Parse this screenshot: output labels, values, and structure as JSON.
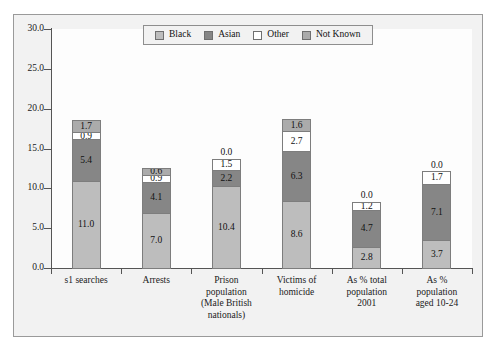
{
  "chart_data": {
    "type": "bar",
    "stacked": true,
    "title": "",
    "subtitle": "",
    "xlabel": "",
    "ylabel": "",
    "ylim": [
      0,
      30
    ],
    "ytick_labels": [
      "0.0",
      "5.0",
      "10.0",
      "15.0",
      "20.0",
      "25.0",
      "30.0"
    ],
    "ytick_values": [
      0,
      5,
      10,
      15,
      20,
      25,
      30
    ],
    "grid": false,
    "legend_position": "top-center",
    "categories": [
      "s1 searches",
      "Arrests",
      "Prison population (Male British nationals)",
      "Victims of homicide",
      "As % total population 2001",
      "As % population aged 10-24"
    ],
    "category_lines": [
      [
        "s1 searches"
      ],
      [
        "Arrests"
      ],
      [
        "Prison",
        "population",
        "(Male British",
        "nationals)"
      ],
      [
        "Victims of",
        "homicide"
      ],
      [
        "As % total",
        "population",
        "2001"
      ],
      [
        "As %",
        "population",
        "aged 10-24"
      ]
    ],
    "series": [
      {
        "name": "Black",
        "color": "#bdbdbd",
        "values": [
          11.0,
          7.0,
          10.4,
          8.6,
          2.8,
          3.7
        ]
      },
      {
        "name": "Asian",
        "color": "#868686",
        "values": [
          5.4,
          4.1,
          2.2,
          6.3,
          4.7,
          7.1
        ]
      },
      {
        "name": "Other",
        "color": "#ffffff",
        "values": [
          0.9,
          0.9,
          1.5,
          2.7,
          1.2,
          1.7
        ]
      },
      {
        "name": "Not Known",
        "color": "#ababab",
        "values": [
          1.7,
          0.6,
          0.0,
          1.6,
          0.0,
          0.0
        ]
      }
    ],
    "data_labels": [
      [
        "11.0",
        "5.4",
        "0.9",
        "1.7"
      ],
      [
        "7.0",
        "4.1",
        "0.9",
        "0.6"
      ],
      [
        "10.4",
        "2.2",
        "1.5",
        "0.0"
      ],
      [
        "8.6",
        "6.3",
        "2.7",
        "1.6"
      ],
      [
        "2.8",
        "4.7",
        "1.2",
        "0.0"
      ],
      [
        "3.7",
        "7.1",
        "1.7",
        "0.0"
      ]
    ],
    "totals": [
      19.0,
      12.6,
      14.1,
      19.2,
      8.7,
      12.5
    ]
  },
  "legend": {
    "items": [
      {
        "label": "Black",
        "swatch": "black"
      },
      {
        "label": "Asian",
        "swatch": "asian"
      },
      {
        "label": "Other",
        "swatch": "other"
      },
      {
        "label": "Not Known",
        "swatch": "notknown"
      }
    ]
  }
}
